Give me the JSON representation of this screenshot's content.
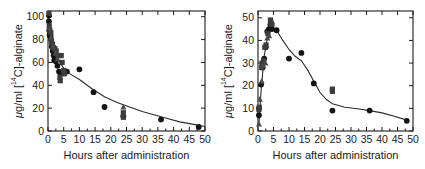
{
  "figure": {
    "panel_count": 2,
    "background": "#ffffff",
    "marker_colors": {
      "circle": "#141414",
      "square": "#3d3d3d",
      "triangle": "#4a4a4a"
    },
    "line_color": "#2b2b2b"
  },
  "chart_data": [
    {
      "type": "scatter",
      "title": "",
      "panel": "left",
      "xlabel": "Hours after administration",
      "ylabel": "μg/ml [¹⁴C]-alginate",
      "ylabel_parts": {
        "prefix": "μg/ml [",
        "sup": "14",
        "suffix": "C]-alginate"
      },
      "xlim": [
        0,
        50
      ],
      "ylim": [
        0,
        105
      ],
      "xticks": [
        0,
        5,
        10,
        15,
        20,
        25,
        30,
        35,
        40,
        45,
        50
      ],
      "yticks": [
        0,
        20,
        40,
        60,
        80,
        100
      ],
      "grid": false,
      "legend": "none",
      "series": [
        {
          "name": "circle",
          "marker": "circle",
          "points": [
            [
              0.3,
              101
            ],
            [
              0.3,
              96
            ],
            [
              0.4,
              88
            ],
            [
              0.5,
              84
            ],
            [
              0.8,
              83
            ],
            [
              1.0,
              80
            ],
            [
              1.2,
              74
            ],
            [
              1.5,
              70
            ],
            [
              1.8,
              66
            ],
            [
              2.0,
              62
            ],
            [
              2.5,
              61
            ],
            [
              3.0,
              57
            ],
            [
              3.5,
              52
            ],
            [
              4.0,
              50
            ],
            [
              6.0,
              52
            ],
            [
              10.0,
              54
            ],
            [
              14.5,
              34
            ],
            [
              18.0,
              21
            ],
            [
              24.0,
              13
            ],
            [
              36.0,
              10
            ],
            [
              48.0,
              3.5
            ]
          ]
        },
        {
          "name": "square",
          "marker": "square",
          "points": [
            [
              0.3,
              103
            ],
            [
              0.4,
              92
            ],
            [
              0.6,
              88
            ],
            [
              0.9,
              86
            ],
            [
              1.1,
              78
            ],
            [
              1.4,
              76
            ],
            [
              1.7,
              73
            ],
            [
              2.2,
              72
            ],
            [
              2.6,
              70
            ],
            [
              3.2,
              66
            ],
            [
              4.2,
              66
            ],
            [
              4.5,
              60
            ],
            [
              5.0,
              53
            ],
            [
              5.2,
              50
            ],
            [
              3.8,
              47
            ],
            [
              3.9,
              44
            ],
            [
              24.0,
              16
            ],
            [
              24.0,
              12
            ]
          ]
        },
        {
          "name": "triangle",
          "marker": "triangle",
          "points": [
            [
              0.5,
              90
            ],
            [
              1.0,
              82
            ],
            [
              1.6,
              74
            ],
            [
              2.4,
              68
            ],
            [
              3.0,
              63
            ],
            [
              24.0,
              21
            ]
          ]
        }
      ],
      "fit_curve": {
        "description": "monoexponential decay fit",
        "points": [
          [
            0.3,
            99
          ],
          [
            1,
            84
          ],
          [
            2,
            72
          ],
          [
            3,
            65
          ],
          [
            4,
            59
          ],
          [
            5,
            55
          ],
          [
            7,
            50
          ],
          [
            10,
            45
          ],
          [
            14,
            37
          ],
          [
            18,
            30
          ],
          [
            22,
            25
          ],
          [
            26,
            21
          ],
          [
            30,
            17
          ],
          [
            34,
            14
          ],
          [
            38,
            11
          ],
          [
            42,
            8
          ],
          [
            46,
            6
          ],
          [
            50,
            4
          ]
        ]
      }
    },
    {
      "type": "scatter",
      "title": "",
      "panel": "right",
      "xlabel": "Hours after administration",
      "ylabel": "μg/ml [¹⁴C]-alginate",
      "ylabel_parts": {
        "prefix": "μg/ml [",
        "sup": "14",
        "suffix": "C]-alginate"
      },
      "xlim": [
        0,
        50
      ],
      "ylim": [
        0,
        53
      ],
      "xticks": [
        0,
        5,
        10,
        15,
        20,
        25,
        30,
        35,
        40,
        45,
        50
      ],
      "yticks": [
        0,
        10,
        20,
        30,
        40,
        50
      ],
      "grid": false,
      "legend": "none",
      "series": [
        {
          "name": "circle",
          "marker": "circle",
          "points": [
            [
              0.3,
              7
            ],
            [
              0.3,
              10
            ],
            [
              1.0,
              20.5
            ],
            [
              1.5,
              28
            ],
            [
              2.0,
              32
            ],
            [
              2.5,
              37
            ],
            [
              3.0,
              44
            ],
            [
              3.5,
              45
            ],
            [
              4.0,
              47
            ],
            [
              4.5,
              45
            ],
            [
              6.0,
              44.5
            ],
            [
              10.0,
              32
            ],
            [
              14.0,
              34.5
            ],
            [
              18.0,
              21
            ],
            [
              24.0,
              9
            ],
            [
              36.0,
              9
            ],
            [
              48.0,
              4.5
            ]
          ]
        },
        {
          "name": "square",
          "marker": "square",
          "points": [
            [
              0.3,
              9.5
            ],
            [
              0.4,
              10.5
            ],
            [
              1.2,
              28
            ],
            [
              1.3,
              30
            ],
            [
              1.8,
              31
            ],
            [
              2.2,
              37
            ],
            [
              2.6,
              38
            ],
            [
              3.2,
              43
            ],
            [
              4.0,
              49
            ],
            [
              4.2,
              48
            ],
            [
              4.5,
              47
            ],
            [
              24.0,
              18.5
            ],
            [
              24.0,
              17.5
            ]
          ]
        },
        {
          "name": "triangle",
          "marker": "triangle",
          "points": [
            [
              0.3,
              3
            ],
            [
              0.6,
              14
            ],
            [
              1.2,
              22
            ],
            [
              1.6,
              29
            ],
            [
              2.4,
              30
            ],
            [
              3.0,
              41
            ],
            [
              3.6,
              42
            ]
          ]
        }
      ],
      "fit_curve": {
        "description": "absorption then elimination fit",
        "points": [
          [
            0.3,
            3
          ],
          [
            1,
            18
          ],
          [
            2,
            33
          ],
          [
            3,
            41
          ],
          [
            4,
            44
          ],
          [
            5,
            45
          ],
          [
            6,
            44.5
          ],
          [
            8,
            40
          ],
          [
            10,
            36
          ],
          [
            12,
            33
          ],
          [
            14,
            31
          ],
          [
            16,
            27
          ],
          [
            18,
            22
          ],
          [
            20,
            17
          ],
          [
            22,
            14
          ],
          [
            24,
            12
          ],
          [
            28,
            10.5
          ],
          [
            32,
            9.8
          ],
          [
            36,
            9
          ],
          [
            40,
            8
          ],
          [
            44,
            6.5
          ],
          [
            48,
            4.8
          ]
        ]
      }
    }
  ]
}
